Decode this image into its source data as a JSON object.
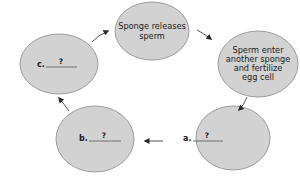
{
  "colors": {
    "ellipse_fill": "#d2d2d2",
    "ellipse_stroke": "#8a8a8a",
    "arrow": "#2a2a2a",
    "blank_line": "#555555",
    "background": "#ffffff"
  },
  "nodes": [
    {
      "id": "top",
      "lines": [
        "Sponge releases",
        "sperm"
      ]
    },
    {
      "id": "right",
      "lines": [
        "Sperm enter",
        "another sponge",
        "and fertilize",
        "egg cell"
      ]
    },
    {
      "id": "a",
      "label": "a.",
      "blank": "?"
    },
    {
      "id": "b",
      "label": "b.",
      "blank": "?"
    },
    {
      "id": "c",
      "label": "c.",
      "blank": "?"
    }
  ],
  "cycle_order": [
    "top",
    "right",
    "a",
    "b",
    "c",
    "top"
  ]
}
